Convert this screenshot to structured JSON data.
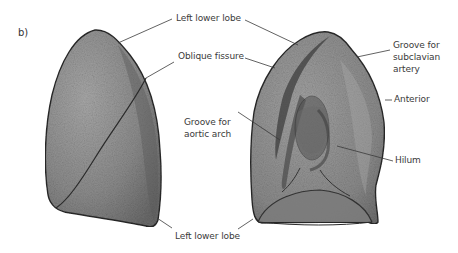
{
  "figure": {
    "panel_label": "b)",
    "labels": {
      "left_lower_lobe_top": "Left lower lobe",
      "oblique_fissure": "Oblique fissure",
      "groove_subclavian_1": "Groove for",
      "groove_subclavian_2": "subclavian",
      "groove_subclavian_3": "artery",
      "anterior": "Anterior",
      "groove_aortic_1": "Groove for",
      "groove_aortic_2": "aortic arch",
      "hilum": "Hilum",
      "left_lower_lobe_bottom": "Left lower lobe"
    },
    "colors": {
      "lung_fill": "#8a8a8a",
      "lung_dark": "#5a5a5a",
      "lung_light": "#b5b5b5",
      "outline": "#2a2a2a",
      "leader_line": "#3a3a3a",
      "text": "#3a3a3a"
    }
  }
}
